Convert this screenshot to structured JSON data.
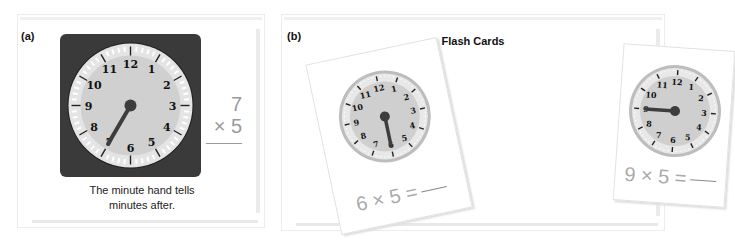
{
  "panel_a": {
    "label": "(a)",
    "clock": {
      "numbers": [
        "12",
        "1",
        "2",
        "3",
        "4",
        "5",
        "6",
        "7",
        "8",
        "9",
        "10",
        "11"
      ],
      "minute_hand_points_to": 7
    },
    "caption_line1": "The minute hand tells",
    "caption_line2": "minutes after.",
    "vertical_problem": {
      "top": "7",
      "bottom": "× 5"
    }
  },
  "panel_b": {
    "label": "(b)",
    "title": "Flash Cards",
    "cards": [
      {
        "equation": "6 × 5 =",
        "minute_hand_points_to": 6
      },
      {
        "equation": "9 × 5 =",
        "minute_hand_points_to": 9
      }
    ]
  },
  "colors": {
    "clock_frame": "#3a3a3a",
    "clock_face": "#d4d4d4",
    "clock_rim": "#bdbdbd",
    "hand": "#3d3d3d",
    "math_gray": "#9a9a9a"
  }
}
